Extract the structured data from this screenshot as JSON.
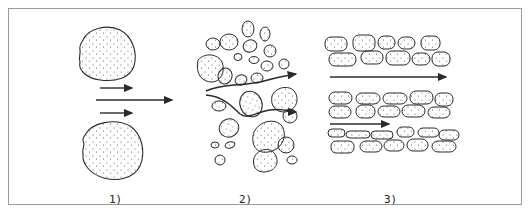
{
  "figure": {
    "panels": [
      {
        "id": "1",
        "label": "1)",
        "description": "Two large grains with flow arrows passing between them",
        "grains": 2,
        "arrows": 3
      },
      {
        "id": "2",
        "label": "2)",
        "description": "Randomly packed grains of varied size with tortuous flow paths",
        "arrows": 2
      },
      {
        "id": "3",
        "label": "3)",
        "description": "Layered elongated grains arranged in rows with straight flow channels",
        "arrows": 2
      }
    ],
    "colors": {
      "stroke": "#2a2a2a",
      "frame": "#9a9a9a",
      "dot": "#555555",
      "background": "#ffffff"
    }
  }
}
